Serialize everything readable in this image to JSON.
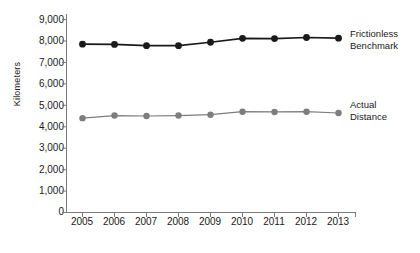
{
  "chart_data": {
    "type": "line",
    "title": "",
    "xlabel": "",
    "ylabel": "Kilometers",
    "categories": [
      "2005",
      "2006",
      "2007",
      "2008",
      "2009",
      "2010",
      "2011",
      "2012",
      "2013"
    ],
    "ylim": [
      0,
      9000
    ],
    "ytick_labels": [
      "9,000",
      "8,000",
      "7,000",
      "6,000",
      "5,000",
      "4,000",
      "3,000",
      "2,000",
      "1,000",
      "0"
    ],
    "ytick_values": [
      9000,
      8000,
      7000,
      6000,
      5000,
      4000,
      3000,
      2000,
      1000,
      0
    ],
    "grid": false,
    "legend_position": "right-inline",
    "series": [
      {
        "name": "Frictionless Benchmark",
        "label_line1": "Frictionless",
        "label_line2": "Benchmark",
        "color": "#1a1a1a",
        "marker": "circle",
        "values": [
          7850,
          7840,
          7780,
          7780,
          7940,
          8120,
          8110,
          8160,
          8130
        ]
      },
      {
        "name": "Actual Distance",
        "label_line1": "Actual",
        "label_line2": "Distance",
        "color": "#7d7d7d",
        "marker": "circle",
        "values": [
          4400,
          4520,
          4500,
          4520,
          4560,
          4700,
          4690,
          4700,
          4640
        ]
      }
    ]
  },
  "axis": {
    "y_axis_label": "Kilometers",
    "axis_color": "#7a7a7a"
  }
}
